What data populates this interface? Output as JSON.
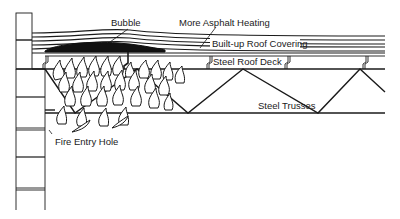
{
  "diagram": {
    "labels": {
      "bubble": "Bubble",
      "more_asphalt_heating": "More Asphalt Heating",
      "built_up_roof_covering": "Built-up Roof Covering",
      "steel_roof_deck": "Steel Roof Deck",
      "steel_trusses": "Steel Trusses",
      "fire_entry_hole": "Fire Entry Hole"
    },
    "colors": {
      "line": "#1a1a1a",
      "background": "#ffffff",
      "bubble_fill": "#111111"
    }
  }
}
